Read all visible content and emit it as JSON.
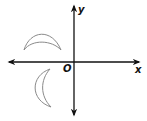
{
  "figure": {
    "axes": {
      "x_label": "x",
      "y_label": "y",
      "origin_label": "O",
      "axis_color": "#111111"
    },
    "shapes": [
      {
        "name": "crescent-upper-left",
        "description": "crescent shape in quadrant II, opening downward",
        "stroke": "#8a8a8a"
      },
      {
        "name": "crescent-lower-left",
        "description": "crescent shape in quadrant III, opening right",
        "stroke": "#8a8a8a"
      }
    ]
  }
}
